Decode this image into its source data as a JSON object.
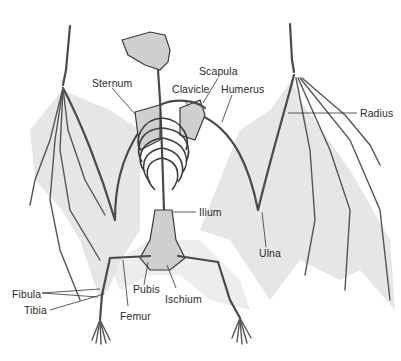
{
  "figure": {
    "colors": {
      "background": "#ffffff",
      "membrane": "#e6e6e6",
      "bone_outline": "#4a4a4a",
      "bone_fill": "#cfcfcf",
      "label_text": "#2a2a2a"
    }
  },
  "labels": {
    "sternum": "Sternum",
    "scapula": "Scapula",
    "clavicle": "Clavicle",
    "humerus": "Humerus",
    "radius": "Radius",
    "ilium": "Ilium",
    "ulna": "Ulna",
    "pubis": "Pubis",
    "ischium": "Ischium",
    "fibula": "Fibula",
    "tibia": "Tibia",
    "femur": "Femur"
  }
}
